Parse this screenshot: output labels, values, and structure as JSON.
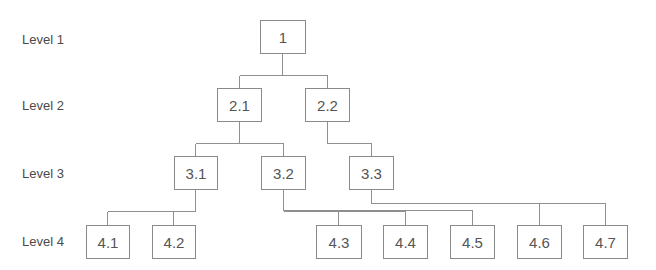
{
  "levels": [
    {
      "label": "Level 1"
    },
    {
      "label": "Level 2"
    },
    {
      "label": "Level 3"
    },
    {
      "label": "Level 4"
    }
  ],
  "nodes": {
    "n1": "1",
    "n2_1": "2.1",
    "n2_2": "2.2",
    "n3_1": "3.1",
    "n3_2": "3.2",
    "n3_3": "3.3",
    "n4_1": "4.1",
    "n4_2": "4.2",
    "n4_3": "4.3",
    "n4_4": "4.4",
    "n4_5": "4.5",
    "n4_6": "4.6",
    "n4_7": "4.7"
  },
  "edges": [
    {
      "from": "1",
      "to": "2.1"
    },
    {
      "from": "1",
      "to": "2.2"
    },
    {
      "from": "2.1",
      "to": "3.1"
    },
    {
      "from": "2.1",
      "to": "3.2"
    },
    {
      "from": "2.2",
      "to": "3.3"
    },
    {
      "from": "3.1",
      "to": "4.1"
    },
    {
      "from": "3.1",
      "to": "4.2"
    },
    {
      "from": "3.2",
      "to": "4.3"
    },
    {
      "from": "3.2",
      "to": "4.4"
    },
    {
      "from": "3.2",
      "to": "4.5"
    },
    {
      "from": "3.3",
      "to": "4.6"
    },
    {
      "from": "3.3",
      "to": "4.7"
    }
  ],
  "colors": {
    "box_border": "#8a8a8a",
    "line": "#8f8f8f",
    "text": "#555555",
    "background": "#ffffff"
  }
}
